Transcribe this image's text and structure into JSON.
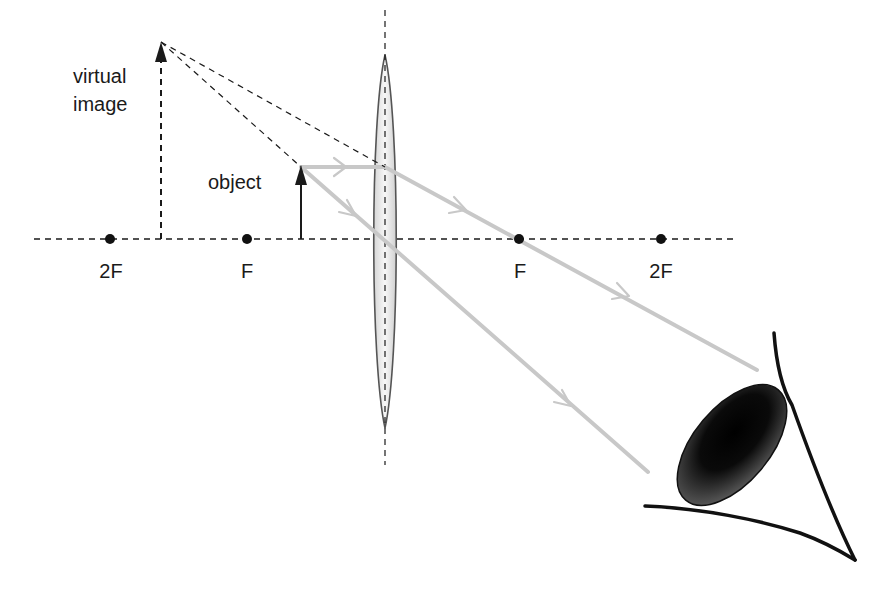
{
  "diagram": {
    "type": "convex-lens-magnifier-ray-diagram",
    "labels": {
      "virtual_image_line1": "virtual",
      "virtual_image_line2": "image",
      "object": "object",
      "left_2f": "2F",
      "left_f": "F",
      "right_f": "F",
      "right_2f": "2F"
    },
    "principal_axis": {
      "y": 239,
      "x_start": 34,
      "x_end": 735
    },
    "lens": {
      "cx": 385,
      "top": 55,
      "bottom": 428,
      "half_width": 12,
      "axis_top": 10,
      "axis_bottom": 465
    },
    "focal_points": [
      {
        "name": "2F-left",
        "x": 110
      },
      {
        "name": "F-left",
        "x": 247
      },
      {
        "name": "F-right",
        "x": 519
      },
      {
        "name": "2F-right",
        "x": 661
      }
    ],
    "object_arrow": {
      "x": 301,
      "base_y": 239,
      "tip_y": 167
    },
    "virtual_image_arrow": {
      "x": 161,
      "base_y": 239,
      "tip_y": 42
    },
    "rays": [
      {
        "name": "parallel-ray",
        "points": [
          [
            301,
            167
          ],
          [
            385,
            167
          ],
          [
            757,
            370
          ]
        ]
      },
      {
        "name": "center-ray",
        "points": [
          [
            301,
            167
          ],
          [
            648,
            472
          ]
        ]
      }
    ],
    "colors": {
      "ray": "#c8c8c8",
      "line": "#1a1a1a",
      "lens_fill": "#e9e9e9",
      "lens_stroke": "#555555"
    }
  }
}
